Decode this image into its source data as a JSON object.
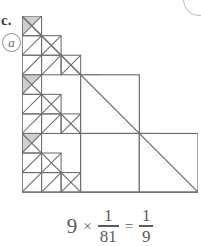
{
  "labels": {
    "item_letter": "c.",
    "circled_mark": "a"
  },
  "figure": {
    "name": "sierpinski-right-triangle",
    "grid_units": 9,
    "orientation": "right-angle-bottom-left",
    "stroke_color": "#6f6f6f",
    "shade_color": "#cfcfcf",
    "hole_color": "#ffffff",
    "level1_blocks": [
      {
        "col": 0,
        "row": 0
      },
      {
        "col": 0,
        "row": 1
      },
      {
        "col": 1,
        "row": 1
      },
      {
        "col": 0,
        "row": 2
      },
      {
        "col": 1,
        "row": 2
      },
      {
        "col": 2,
        "row": 2
      }
    ],
    "shaded_count": 9,
    "shaded_fraction_each": "1/81",
    "shaded_fraction_total": "1/9"
  },
  "equation": {
    "multiplier": "9",
    "times_symbol": "×",
    "fraction_a_numerator": "1",
    "fraction_a_denominator": "81",
    "equals_symbol": "=",
    "fraction_b_numerator": "1",
    "fraction_b_denominator": "9",
    "full_text": "9 × 1/81 = 1/9"
  },
  "chart_data": {
    "type": "diagram",
    "title": "9 × 1/81 = 1/9",
    "categories": [
      "shaded",
      "unshaded"
    ],
    "values": [
      9,
      72
    ]
  }
}
